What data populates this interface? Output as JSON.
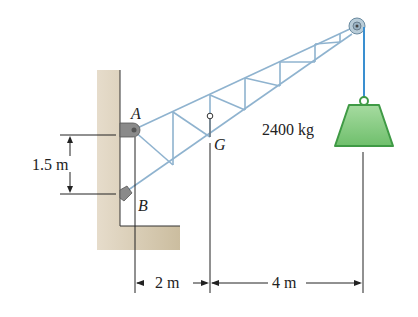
{
  "diagram": {
    "type": "crane truss statics problem",
    "labels": {
      "pin_a": "A",
      "support_b": "B",
      "center_of_gravity": "G",
      "mass": "2400 kg",
      "vertical_dim": "1.5 m",
      "dim_left": "2 m",
      "dim_right": "4 m"
    },
    "colors": {
      "wall": "#d8cdb8",
      "truss": "#8fb3cf",
      "cable": "#3a8fd0",
      "weight": "#7cc47a",
      "weight_edge": "#3f9a45"
    }
  }
}
